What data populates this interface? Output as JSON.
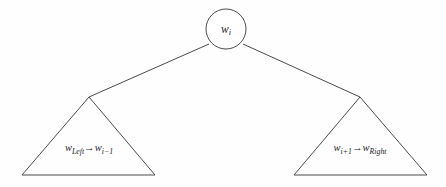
{
  "figure": {
    "background_color": "#fefefe",
    "stroke_color": "#4a4a4a",
    "text_color": "#25252b"
  },
  "root": {
    "shape": "circle",
    "center_x": 226,
    "center_y": 29,
    "radius": 20,
    "label_base": "w",
    "label_sub": "i"
  },
  "left_subtree": {
    "shape": "triangle",
    "apex_x": 89,
    "apex_y": 97,
    "base_left_x": 22,
    "base_right_x": 155,
    "base_y": 175,
    "label_x": 89,
    "label_y": 149,
    "from_base": "w",
    "from_sub": "Left",
    "arrow": "→",
    "to_base": "w",
    "to_sub": "i−1"
  },
  "right_subtree": {
    "shape": "triangle",
    "apex_x": 360,
    "apex_y": 97,
    "base_left_x": 294,
    "base_right_x": 427,
    "base_y": 175,
    "label_x": 360,
    "label_y": 149,
    "from_base": "w",
    "from_sub": "i+1",
    "arrow": "→",
    "to_base": "w",
    "to_sub": "Right"
  },
  "edges": {
    "left_edge_start_x": 209,
    "left_edge_start_y": 44,
    "left_edge_end_x": 89,
    "left_edge_end_y": 97,
    "right_edge_start_x": 243,
    "right_edge_start_y": 44,
    "right_edge_end_x": 360,
    "right_edge_end_y": 97
  }
}
